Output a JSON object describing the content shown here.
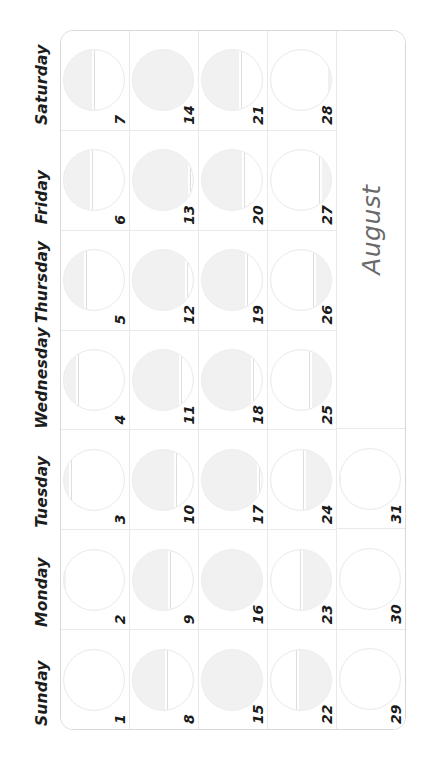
{
  "month": {
    "name": "August",
    "label_color": "#6a6a6a"
  },
  "weekdays": [
    {
      "label": "Sunday"
    },
    {
      "label": "Monday"
    },
    {
      "label": "Tuesday"
    },
    {
      "label": "Wednesday"
    },
    {
      "label": "Thursday"
    },
    {
      "label": "Friday"
    },
    {
      "label": "Saturday"
    }
  ],
  "theme": {
    "grid_line": "#e9e9e9",
    "border": "#d8d8d8",
    "moon_fill": "#f1f1f1",
    "moon_outline": "#ececec",
    "text": "#1a1a1a",
    "page_background": "#ffffff"
  },
  "weeks": [
    {
      "index": 1,
      "days": [
        {
          "number": "1",
          "weekday": "Sunday",
          "moon_phase": "new-moon",
          "illumination": 4
        },
        {
          "number": "2",
          "weekday": "Monday",
          "moon_phase": "waxing-crescent",
          "illumination": 8
        },
        {
          "number": "3",
          "weekday": "Tuesday",
          "moon_phase": "waxing-crescent",
          "illumination": 13
        },
        {
          "number": "4",
          "weekday": "Wednesday",
          "moon_phase": "waxing-crescent",
          "illumination": 24
        },
        {
          "number": "5",
          "weekday": "Thursday",
          "moon_phase": "waxing-crescent",
          "illumination": 38
        },
        {
          "number": "6",
          "weekday": "Friday",
          "moon_phase": "first-quarter",
          "illumination": 48
        },
        {
          "number": "7",
          "weekday": "Saturday",
          "moon_phase": "first-quarter",
          "illumination": 50
        }
      ]
    },
    {
      "index": 2,
      "days": [
        {
          "number": "8",
          "weekday": "Sunday",
          "moon_phase": "waxing-gibbous",
          "illumination": 58
        },
        {
          "number": "9",
          "weekday": "Monday",
          "moon_phase": "waxing-gibbous",
          "illumination": 63
        },
        {
          "number": "10",
          "weekday": "Tuesday",
          "moon_phase": "waxing-gibbous",
          "illumination": 72
        },
        {
          "number": "11",
          "weekday": "Wednesday",
          "moon_phase": "waxing-gibbous",
          "illumination": 81
        },
        {
          "number": "12",
          "weekday": "Thursday",
          "moon_phase": "waxing-gibbous",
          "illumination": 90
        },
        {
          "number": "13",
          "weekday": "Friday",
          "moon_phase": "waxing-gibbous",
          "illumination": 96
        },
        {
          "number": "14",
          "weekday": "Saturday",
          "moon_phase": "full-moon",
          "illumination": 100
        }
      ]
    },
    {
      "index": 3,
      "days": [
        {
          "number": "15",
          "weekday": "Sunday",
          "moon_phase": "full-moon",
          "illumination": 100
        },
        {
          "number": "16",
          "weekday": "Monday",
          "moon_phase": "full-moon",
          "illumination": 99
        },
        {
          "number": "17",
          "weekday": "Tuesday",
          "moon_phase": "waning-gibbous",
          "illumination": 95
        },
        {
          "number": "18",
          "weekday": "Wednesday",
          "moon_phase": "waning-gibbous",
          "illumination": 85
        },
        {
          "number": "19",
          "weekday": "Thursday",
          "moon_phase": "waning-gibbous",
          "illumination": 76
        },
        {
          "number": "20",
          "weekday": "Friday",
          "moon_phase": "waning-gibbous",
          "illumination": 70
        },
        {
          "number": "21",
          "weekday": "Saturday",
          "moon_phase": "waning-gibbous",
          "illumination": 66
        }
      ]
    },
    {
      "index": 4,
      "days": [
        {
          "number": "22",
          "weekday": "Sunday",
          "moon_phase": "last-quarter",
          "illumination": 56
        },
        {
          "number": "23",
          "weekday": "Monday",
          "moon_phase": "last-quarter",
          "illumination": 50
        },
        {
          "number": "24",
          "weekday": "Tuesday",
          "moon_phase": "waning-crescent",
          "illumination": 44
        },
        {
          "number": "25",
          "weekday": "Wednesday",
          "moon_phase": "waning-crescent",
          "illumination": 35
        },
        {
          "number": "26",
          "weekday": "Thursday",
          "moon_phase": "waning-crescent",
          "illumination": 27
        },
        {
          "number": "27",
          "weekday": "Friday",
          "moon_phase": "waning-crescent",
          "illumination": 18
        },
        {
          "number": "28",
          "weekday": "Saturday",
          "moon_phase": "waning-crescent",
          "illumination": 8
        }
      ]
    },
    {
      "index": 5,
      "days": [
        {
          "number": "29",
          "weekday": "Sunday",
          "moon_phase": "new-moon",
          "illumination": 2
        },
        {
          "number": "30",
          "weekday": "Monday",
          "moon_phase": "new-moon",
          "illumination": 1
        },
        {
          "number": "31",
          "weekday": "Tuesday",
          "moon_phase": "new-moon",
          "illumination": 6
        },
        {
          "number": "",
          "weekday": "Wednesday",
          "moon_phase": "month-label",
          "illumination": 0
        },
        {
          "number": "",
          "weekday": "Thursday",
          "moon_phase": "month-label",
          "illumination": 0
        },
        {
          "number": "",
          "weekday": "Friday",
          "moon_phase": "month-label",
          "illumination": 0
        },
        {
          "number": "",
          "weekday": "Saturday",
          "moon_phase": "month-label",
          "illumination": 0
        }
      ]
    }
  ]
}
